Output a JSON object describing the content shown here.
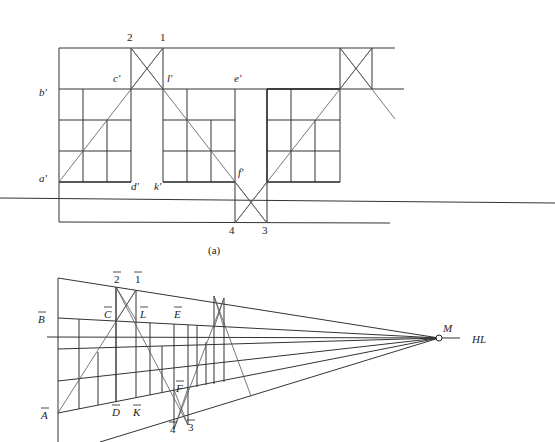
{
  "figure_a": {
    "caption": "(a)",
    "labels": {
      "b_prime": "b'",
      "a_prime": "a'",
      "c_prime": "c'",
      "d_prime": "d'",
      "l_prime": "l'",
      "k_prime": "k'",
      "e_prime": "e'",
      "f_prime": "f'",
      "n1": "1",
      "n2": "2",
      "n3": "3",
      "n4": "4"
    }
  },
  "figure_b": {
    "labels": {
      "B": "B",
      "A": "A",
      "C": "C",
      "D": "D",
      "L": "L",
      "K": "K",
      "E": "E",
      "F": "F",
      "n1": "1",
      "n2": "2",
      "n3": "3",
      "n4": "4",
      "M": "M",
      "HL": "HL"
    }
  }
}
